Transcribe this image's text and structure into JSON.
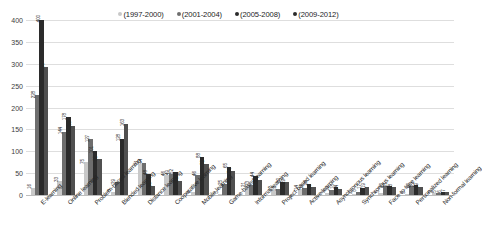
{
  "chart_data": {
    "type": "bar",
    "title": "",
    "subtitle": "",
    "xlabel": "",
    "ylabel": "",
    "ylim": [
      0,
      400
    ],
    "ytick_labels": [
      "400",
      "350",
      "300",
      "250",
      "200",
      "150",
      "100",
      "50",
      "0"
    ],
    "ytick_values": [
      400,
      350,
      300,
      250,
      200,
      150,
      100,
      50,
      0
    ],
    "grid": true,
    "legend_position": "top-center",
    "categories": [
      "E-learning",
      "Online learning",
      "Problem-based learning",
      "Blended learning",
      "Distance learning",
      "Cooperative learning",
      "Mobile learning",
      "Game-based learning",
      "Informal learning",
      "Project-based learning",
      "Active learning",
      "Asynchronous learning",
      "Synchronous learning",
      "Face-to-face learning",
      "Personalized learning",
      "Non-formal learning"
    ],
    "series": [
      {
        "name": "(1997-2000)",
        "color": "#c8c8c8",
        "values": [
          16,
          33,
          75,
          8,
          71,
          46,
          6,
          3,
          21,
          12,
          14,
          5,
          2,
          5,
          3,
          5
        ]
      },
      {
        "name": "(2001-2004)",
        "color": "#6e6e6e",
        "values": [
          228,
          144,
          127,
          29,
          74,
          49,
          46,
          25,
          23,
          13,
          16,
          12,
          8,
          20,
          20,
          5
        ]
      },
      {
        "name": "(2005-2008)",
        "color": "#2b2b2b",
        "values": [
          400,
          178,
          101,
          128,
          48,
          52,
          88,
          65,
          44,
          30,
          26,
          18,
          17,
          21,
          22,
          6
        ]
      },
      {
        "name": "(2009-2012)",
        "color": "#505050",
        "values": [
          292,
          158,
          82,
          163,
          21,
          33,
          72,
          54,
          34,
          29,
          18,
          14,
          19,
          18,
          19,
          7
        ]
      }
    ]
  }
}
